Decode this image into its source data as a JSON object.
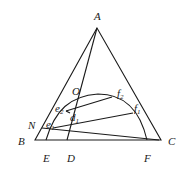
{
  "diagram": {
    "type": "ternary-phase-diagram",
    "vertices": {
      "A": "A",
      "B": "B",
      "C": "C"
    },
    "points": {
      "O": "O",
      "N": "N",
      "E": "E",
      "D": "D",
      "F": "F",
      "e1": {
        "base": "e",
        "sub": "1"
      },
      "e2": {
        "base": "e",
        "sub": "2"
      },
      "d1": {
        "base": "d",
        "sub": "1"
      },
      "f1": {
        "base": "f",
        "sub": "1"
      },
      "f2": {
        "base": "f",
        "sub": "2"
      }
    }
  }
}
